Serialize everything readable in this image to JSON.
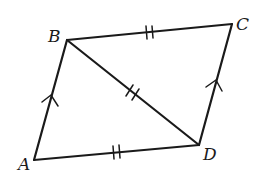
{
  "diagram": {
    "type": "parallelogram",
    "vertices": {
      "A": {
        "label": "A",
        "x": 34,
        "y": 160
      },
      "B": {
        "label": "B",
        "x": 67,
        "y": 40
      },
      "C": {
        "label": "C",
        "x": 232,
        "y": 24
      },
      "D": {
        "label": "D",
        "x": 199,
        "y": 145
      }
    },
    "segments": [
      {
        "from": "A",
        "to": "B",
        "mark": "parallel-arrow"
      },
      {
        "from": "B",
        "to": "C",
        "mark": "double-tick"
      },
      {
        "from": "C",
        "to": "D",
        "mark": "parallel-arrow"
      },
      {
        "from": "D",
        "to": "A",
        "mark": "double-tick"
      },
      {
        "from": "B",
        "to": "D",
        "mark": "double-tick"
      }
    ],
    "stroke_color": "#1a1a1a",
    "background": "#ffffff"
  }
}
